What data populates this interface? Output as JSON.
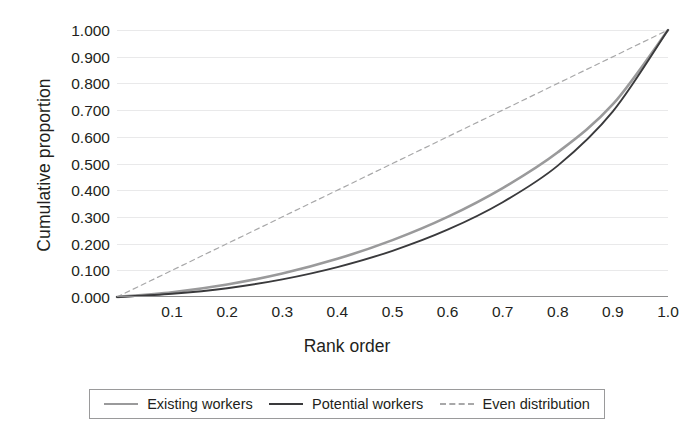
{
  "chart_data": {
    "type": "line",
    "title": "",
    "xlabel": "Rank order",
    "ylabel": "Cumulative proportion",
    "xlim": [
      0,
      1.0
    ],
    "ylim": [
      0,
      1.0
    ],
    "grid": true,
    "legend_position": "bottom",
    "x_ticks": [
      "0.1",
      "0.2",
      "0.3",
      "0.4",
      "0.5",
      "0.6",
      "0.7",
      "0.8",
      "0.9",
      "1.0"
    ],
    "x_tick_values": [
      0.1,
      0.2,
      0.3,
      0.4,
      0.5,
      0.6,
      0.7,
      0.8,
      0.9,
      1.0
    ],
    "y_ticks": [
      "0.000",
      "0.100",
      "0.200",
      "0.300",
      "0.400",
      "0.500",
      "0.600",
      "0.700",
      "0.800",
      "0.900",
      "1.000"
    ],
    "y_tick_values": [
      0.0,
      0.1,
      0.2,
      0.3,
      0.4,
      0.5,
      0.6,
      0.7,
      0.8,
      0.9,
      1.0
    ],
    "x": [
      0.0,
      0.1,
      0.2,
      0.3,
      0.4,
      0.5,
      0.6,
      0.7,
      0.8,
      0.9,
      1.0
    ],
    "series": [
      {
        "name": "Existing workers",
        "color": "#9a9a9b",
        "style": "solid",
        "width": 2.6,
        "values": [
          0.0,
          0.018,
          0.047,
          0.088,
          0.143,
          0.213,
          0.3,
          0.408,
          0.542,
          0.722,
          1.0
        ]
      },
      {
        "name": "Potential workers",
        "color": "#3a3a3c",
        "style": "solid",
        "width": 1.9,
        "values": [
          0.0,
          0.012,
          0.033,
          0.066,
          0.112,
          0.173,
          0.252,
          0.355,
          0.492,
          0.695,
          1.0
        ]
      },
      {
        "name": "Even distribution",
        "color": "#a8a8a9",
        "style": "dashed",
        "width": 1.2,
        "values": [
          0.0,
          0.1,
          0.2,
          0.3,
          0.4,
          0.5,
          0.6,
          0.7,
          0.8,
          0.9,
          1.0
        ]
      }
    ]
  },
  "legend": {
    "items": [
      {
        "label": "Existing workers"
      },
      {
        "label": "Potential workers"
      },
      {
        "label": "Even distribution"
      }
    ]
  }
}
